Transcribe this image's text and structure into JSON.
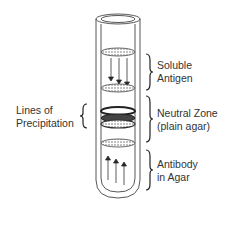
{
  "diagram": {
    "labels": {
      "soluble_antigen": [
        "Soluble",
        "Antigen"
      ],
      "neutral_zone": [
        "Neutral Zone",
        "(plain agar)"
      ],
      "antibody": [
        "Antibody",
        "in Agar"
      ],
      "precipitation": [
        "Lines of",
        "Precipitation"
      ]
    },
    "colors": {
      "line": "#333333",
      "text": "#333333",
      "background": "#ffffff"
    }
  }
}
